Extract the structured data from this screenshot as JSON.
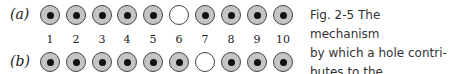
{
  "figure": {
    "row_labels": [
      "(a)",
      "(b)"
    ],
    "numbers": [
      "1",
      "2",
      "3",
      "4",
      "5",
      "6",
      "7",
      "8",
      "9",
      "10"
    ],
    "row_a_hole_index": 6,
    "row_b_hole_index": 7,
    "caption": "Fig. 2-5   The mechanism by which a hole contributes to the conductivity.",
    "caption_lines": [
      "Fig. 2-5   The mechanism",
      "by which a hole contri-",
      "butes to the conductivity."
    ]
  }
}
